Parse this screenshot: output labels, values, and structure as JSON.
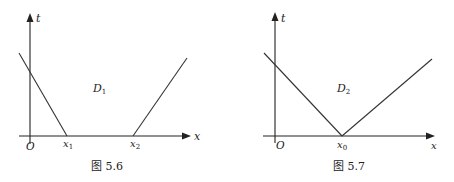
{
  "figures": [
    {
      "id": "fig-5-6",
      "caption": "图 5.6",
      "region_label": "D",
      "region_sub": "1",
      "axes": {
        "x_label": "x",
        "y_label": "t",
        "origin_label": "O"
      },
      "tick_labels": [
        {
          "main": "x",
          "sub": "1"
        },
        {
          "main": "x",
          "sub": "2"
        }
      ],
      "lines": [
        {
          "from": [
            19,
            53
          ],
          "to": [
            67,
            136
          ]
        },
        {
          "from": [
            133,
            136
          ],
          "to": [
            187,
            58
          ]
        }
      ]
    },
    {
      "id": "fig-5-7",
      "caption": "图 5.7",
      "region_label": "D",
      "region_sub": "2",
      "axes": {
        "x_label": "x",
        "y_label": "t",
        "origin_label": "O"
      },
      "tick_labels": [
        {
          "main": "x",
          "sub": "0"
        }
      ],
      "lines": [
        {
          "from": [
            264,
            53
          ],
          "to": [
            342,
            136
          ]
        },
        {
          "from": [
            342,
            136
          ],
          "to": [
            432,
            59
          ]
        }
      ]
    }
  ]
}
